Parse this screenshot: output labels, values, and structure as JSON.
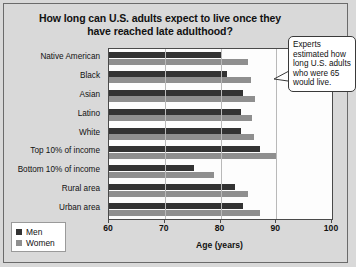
{
  "title": "How long can U.S. adults expect to live once they have reached late adulthood?",
  "callout": "Experts estimated how long U.S. adults who were 65 would live.",
  "legend": {
    "men": "Men",
    "women": "Women"
  },
  "axis": {
    "xlabel": "Age (years)",
    "ticks": [
      "60",
      "70",
      "80",
      "90",
      "100"
    ]
  },
  "colors": {
    "men": "#333333",
    "women": "#8f8f8f",
    "background": "#d9d9d9",
    "plot": "#fdfdfd"
  },
  "chart_data": {
    "type": "bar",
    "orientation": "horizontal",
    "title": "How long can U.S. adults expect to live once they have reached late adulthood?",
    "xlabel": "Age (years)",
    "ylabel": "",
    "xlim": [
      60,
      100
    ],
    "xticks": [
      60,
      70,
      80,
      90,
      100
    ],
    "grid": true,
    "legend_position": "bottom-left",
    "categories": [
      "Native American",
      "Black",
      "Asian",
      "Latino",
      "White",
      "Top 10% of income",
      "Bottom 10% of income",
      "Rural area",
      "Urban area"
    ],
    "series": [
      {
        "name": "Men",
        "values": [
          80.1,
          81.2,
          84.1,
          83.7,
          83.7,
          87.1,
          75.3,
          82.6,
          84.1
        ]
      },
      {
        "name": "Women",
        "values": [
          85.0,
          85.5,
          86.2,
          85.7,
          86.0,
          90.2,
          78.8,
          85.0,
          87.1
        ]
      }
    ],
    "annotations": [
      "Experts estimated how long U.S. adults who were 65 would live."
    ]
  }
}
